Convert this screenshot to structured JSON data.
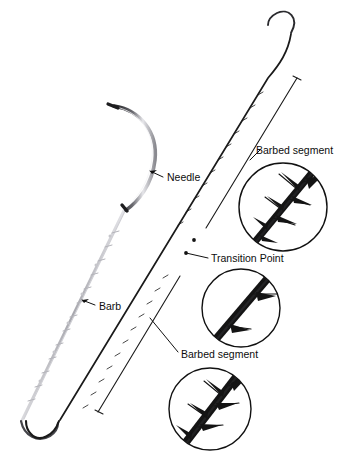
{
  "figure": {
    "background_color": "#ffffff",
    "width": 350,
    "height": 454
  },
  "palette": {
    "ink": "#111111",
    "suture_dark": "#1a1a1a",
    "suture_light": "#b9b9bd",
    "needle_dark": "#1d1d1f",
    "needle_light": "#d8d8dc",
    "inset_stroke": "#111111",
    "leader": "#111111",
    "label_text": "#0d0d0d"
  },
  "labels": {
    "needle": "Needle",
    "barb": "Barb",
    "transition_point": "Transition Point",
    "barbed_segment_upper": "Barbed segment",
    "barbed_segment_lower": "Barbed segment"
  },
  "components": {
    "needle": {
      "name": "curved-surgical-needle",
      "description": "Curved crescent needle with tapered point at upper left"
    },
    "suture_light": {
      "name": "light-barbed-suture-strand",
      "description": "Pale gray barbed suture running from needle swage down to lower-left hook"
    },
    "suture_dark": {
      "name": "dark-barbed-suture-strand",
      "description": "Dark suture running from upper-right hook down to lower-left hook"
    },
    "transition_markers": {
      "name": "transition-point-markers",
      "count": 2
    },
    "brackets": {
      "upper_segment": "barbed segment extent bracket upper",
      "lower_segment": "barbed segment extent bracket lower"
    }
  },
  "insets": [
    {
      "id": "inset-top",
      "name": "magnified-barbed-segment-top",
      "cx": 283,
      "cy": 207,
      "r": 44,
      "label": "Barbed segment",
      "detail": "Diagonal strand with several outward-angled barbs on both sides"
    },
    {
      "id": "inset-middle",
      "name": "magnified-transition-point",
      "cx": 241,
      "cy": 308,
      "r": 39,
      "label": "Transition Point",
      "detail": "Thick diagonal strand with two sparse barbs near the transition"
    },
    {
      "id": "inset-bottom",
      "name": "magnified-barbed-segment-bottom",
      "cx": 210,
      "cy": 409,
      "r": 41,
      "label": "Barbed segment",
      "detail": "Diagonal strand with multiple barbs angled upward on both sides"
    }
  ]
}
